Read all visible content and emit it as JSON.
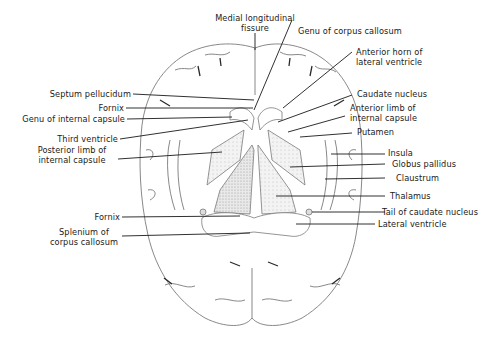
{
  "figure": {
    "labels": {
      "medial_longitudinal_fissure": {
        "line1": "Medial longitudinal",
        "line2": "fissure"
      },
      "genu_corpus_callosum": "Genu of corpus callosum",
      "anterior_horn": {
        "line1": "Anterior horn of",
        "line2": "lateral ventricle"
      },
      "caudate_nucleus": "Caudate nucleus",
      "anterior_limb": {
        "line1": "Anterior limb of",
        "line2": "internal capsule"
      },
      "putamen": "Putamen",
      "insula": "Insula",
      "globus_pallidus": "Globus pallidus",
      "claustrum": "Claustrum",
      "thalamus": "Thalamus",
      "tail_caudate": "Tail of caudate nucleus",
      "lateral_ventricle": "Lateral ventricle",
      "septum_pellucidum": "Septum pellucidum",
      "fornix_upper": "Fornix",
      "genu_internal_capsule": "Genu of internal capsule",
      "third_ventricle": "Third ventricle",
      "posterior_limb": {
        "line1": "Posterior limb of",
        "line2": "internal capsule"
      },
      "fornix_lower": "Fornix",
      "splenium": {
        "line1": "Splenium of",
        "line2": "corpus callosum"
      }
    },
    "colors": {
      "ink": "#1a1a1a",
      "outline": "#7a7a7a",
      "shade": "#c9c9c9"
    }
  }
}
